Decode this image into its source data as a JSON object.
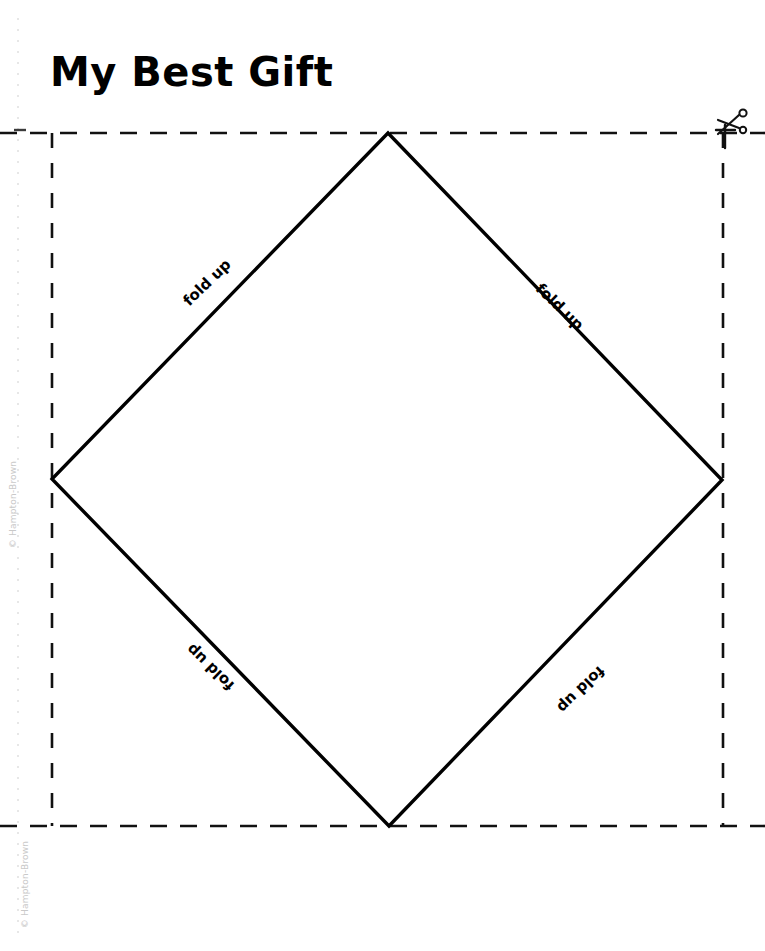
{
  "document": {
    "title": "My Best Gift",
    "page_background": "#ffffff",
    "ink_color": "#000000",
    "width": 765,
    "height": 951
  },
  "labels": {
    "fold_up": "fold up",
    "fold_top_left": "fold up",
    "fold_top_right": "fold up",
    "fold_bottom_left": "fold up",
    "fold_bottom_right": "fold up"
  },
  "icons": {
    "scissors": "scissors-icon"
  },
  "credits": {
    "left": "© Hampton-Brown",
    "bottom": "© Hampton-Brown"
  },
  "geometry": {
    "cut_rect": {
      "left": 52,
      "top": 133,
      "right": 723,
      "bottom": 826
    },
    "diamond": {
      "top": {
        "x": 388,
        "y": 133
      },
      "right": {
        "x": 722,
        "y": 480
      },
      "bottom": {
        "x": 389,
        "y": 826
      },
      "left": {
        "x": 52,
        "y": 479
      }
    },
    "margin_guide_x": 18,
    "cut_line_style": "dashed",
    "fold_line_style": "solid"
  }
}
